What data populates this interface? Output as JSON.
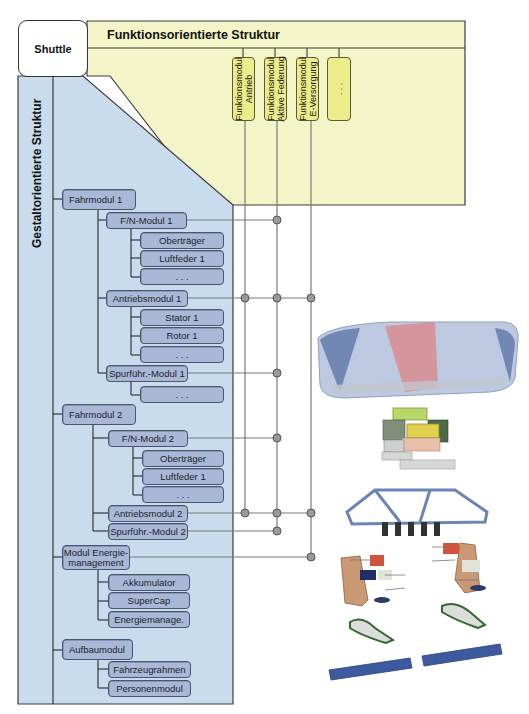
{
  "root": {
    "label": "Shuttle"
  },
  "functional_structure": {
    "title": "Funktionsorientierte Struktur",
    "modules": [
      {
        "label_line1": "Funktionsmodul",
        "label_line2": "Antrieb"
      },
      {
        "label_line1": "Funktionsmodul",
        "label_line2": "Aktive Federung"
      },
      {
        "label_line1": "Funktionsmodul",
        "label_line2": "E-Versorgung"
      },
      {
        "label_line1": ". . .",
        "label_line2": ""
      }
    ]
  },
  "form_structure": {
    "title": "Gestaltorientierte Struktur",
    "modules": [
      {
        "label": "Fahrmodul 1",
        "children": [
          {
            "label": "F/N-Modul 1",
            "children": [
              "Oberträger",
              "Luftfeder 1",
              ". . ."
            ]
          },
          {
            "label": "Antriebsmodul 1",
            "children": [
              "Stator 1",
              "Rotor 1",
              ". . ."
            ]
          },
          {
            "label": "Spurführ.-Modul 1",
            "children": [
              ". . ."
            ]
          }
        ]
      },
      {
        "label": "Fahrmodul 2",
        "children": [
          {
            "label": "F/N-Modul 2",
            "children": [
              "Oberträger",
              "Luftfeder 1",
              ". . ."
            ]
          },
          {
            "label": "Antriebsmodul 2",
            "children": []
          },
          {
            "label": "Spurführ.-Modul 2",
            "children": []
          }
        ]
      },
      {
        "label_line1": "Modul Energie-",
        "label_line2": "management",
        "children": [
          "Akkumulator",
          "SuperCap",
          "Energiemanage."
        ]
      },
      {
        "label": "Aufbaumodul",
        "children": [
          "Fahrzeugrahmen",
          "Personenmodul"
        ]
      }
    ]
  },
  "connections": [
    {
      "from": "F/N-Modul 1",
      "to": [
        "Funktionsmodul Aktive Federung"
      ]
    },
    {
      "from": "Antriebsmodul 1",
      "to": [
        "Funktionsmodul Antrieb",
        "Funktionsmodul Aktive Federung",
        "Funktionsmodul E-Versorgung"
      ]
    },
    {
      "from": "Spurführ.-Modul 1",
      "to": [
        "Funktionsmodul Aktive Federung"
      ]
    },
    {
      "from": "F/N-Modul 2",
      "to": [
        "Funktionsmodul Aktive Federung"
      ]
    },
    {
      "from": "Antriebsmodul 2",
      "to": [
        "Funktionsmodul Antrieb",
        "Funktionsmodul Aktive Federung",
        "Funktionsmodul E-Versorgung"
      ]
    },
    {
      "from": "Spurführ.-Modul 2",
      "to": [
        "Funktionsmodul Aktive Federung"
      ]
    },
    {
      "from": "Modul Energiemanagement",
      "to": [
        "Funktionsmodul E-Versorgung"
      ]
    }
  ],
  "colors": {
    "yellow_panel": "#f3f5c8",
    "blue_panel": "#c8dcee",
    "node_fill": "#a9b8d6",
    "func_fill": "#ecec8a",
    "connector": "#7a7a7a",
    "dot": "#9a9a9a"
  },
  "illustration": {
    "description": "exploded 3D view of shuttle vehicle: body shell, battery pack, frame, drive units, guidance modules, rails"
  }
}
